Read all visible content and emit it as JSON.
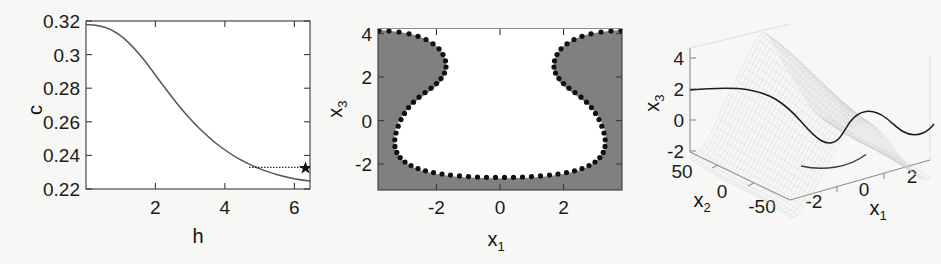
{
  "figure": {
    "background_color": "#f7f7f5",
    "panel_count": 3
  },
  "chart_data": [
    {
      "type": "line",
      "panel": "left",
      "title": "",
      "xlabel": "h",
      "ylabel": "c",
      "xlim": [
        0,
        6.45
      ],
      "ylim": [
        0.22,
        0.32
      ],
      "xticks": [
        2,
        4,
        6
      ],
      "xtick_labels": [
        "2",
        "4",
        "6"
      ],
      "yticks": [
        0.22,
        0.24,
        0.26,
        0.28,
        0.3,
        0.32
      ],
      "ytick_labels": [
        "0.22",
        "0.24",
        "0.26",
        "0.28",
        "0.3",
        "0.32"
      ],
      "grid": false,
      "legend": "none",
      "series": [
        {
          "name": "c(h)",
          "style": "solid-line",
          "color": "#555555",
          "x": [
            0.15,
            0.4,
            0.7,
            1.0,
            1.3,
            1.6,
            1.9,
            2.2,
            2.5,
            2.8,
            3.1,
            3.4,
            3.7,
            4.0,
            4.3,
            4.6,
            4.9,
            5.2,
            5.5,
            5.8,
            6.1,
            6.35
          ],
          "y": [
            0.3165,
            0.316,
            0.3145,
            0.3115,
            0.307,
            0.301,
            0.294,
            0.2865,
            0.2785,
            0.2705,
            0.2628,
            0.2556,
            0.249,
            0.2432,
            0.2383,
            0.2342,
            0.231,
            0.2285,
            0.2265,
            0.2248,
            0.2234,
            0.2226
          ]
        },
        {
          "name": "asymptote-marker-line",
          "style": "dotted-line",
          "color": "#2b2b2b",
          "x": [
            4.68,
            6.22
          ],
          "y": [
            0.2327,
            0.2327
          ]
        }
      ],
      "markers": [
        {
          "name": "star-marker",
          "symbol": "star",
          "x": 6.22,
          "y": 0.2327,
          "color": "#111111"
        }
      ]
    },
    {
      "type": "line",
      "panel": "middle",
      "title": "",
      "xlabel": "x_1",
      "xlabel_base": "x",
      "xlabel_sub": "1",
      "ylabel": "x_3",
      "ylabel_base": "x",
      "ylabel_sub": "3",
      "xlim": [
        -2.85,
        2.85
      ],
      "ylim": [
        -3.15,
        4.2
      ],
      "xticks": [
        -2,
        0,
        2
      ],
      "xtick_labels": [
        "-2",
        "0",
        "2"
      ],
      "yticks": [
        -2,
        0,
        2,
        4
      ],
      "ytick_labels": [
        "-2",
        "0",
        "2",
        "4"
      ],
      "grid": false,
      "legend": "none",
      "region_fill_color": "#808080",
      "region_inner_color": "#ffffff",
      "description": "gray region with white basin of attraction bounded by black dotted boundary points",
      "boundary_points_x": [
        -2.85,
        -2.62,
        -2.4,
        -2.18,
        -1.97,
        -1.78,
        -1.61,
        -1.46,
        -1.34,
        -1.25,
        -1.19,
        -1.16,
        -1.16,
        -1.19,
        -1.25,
        -1.34,
        -1.45,
        -1.57,
        -1.69,
        -1.8,
        -1.89,
        -1.96,
        -2.0,
        -2.01,
        -1.99,
        -1.94,
        -1.86,
        -1.75,
        -1.62,
        -1.47,
        -1.3,
        -1.12,
        -0.93,
        -0.73,
        -0.52,
        -0.31,
        -0.1,
        0.1,
        0.31,
        0.52,
        0.73,
        0.93,
        1.12,
        1.3,
        1.47,
        1.62,
        1.75,
        1.86,
        1.94,
        1.99,
        2.01,
        2.0,
        1.96,
        1.89,
        1.8,
        1.69,
        1.57,
        1.45,
        1.34,
        1.25,
        1.19,
        1.16,
        1.16,
        1.19,
        1.25,
        1.34,
        1.46,
        1.61,
        1.78,
        1.97,
        2.18,
        2.4,
        2.62,
        2.85
      ],
      "boundary_points_y": [
        3.95,
        3.92,
        3.86,
        3.76,
        3.62,
        3.44,
        3.23,
        2.99,
        2.73,
        2.46,
        2.18,
        1.9,
        1.62,
        1.35,
        1.09,
        0.86,
        0.65,
        0.46,
        0.29,
        0.13,
        -0.03,
        -0.2,
        -0.39,
        -0.59,
        -0.8,
        -1.01,
        -1.22,
        -1.42,
        -1.6,
        -1.76,
        -1.9,
        -2.02,
        -2.11,
        -2.18,
        -2.22,
        -2.25,
        -2.26,
        -2.26,
        -2.25,
        -2.22,
        -2.18,
        -2.11,
        -2.02,
        -1.9,
        -1.76,
        -1.6,
        -1.42,
        -1.22,
        -1.01,
        -0.8,
        -0.59,
        -0.39,
        -0.2,
        -0.03,
        0.13,
        0.29,
        0.46,
        0.65,
        0.86,
        1.09,
        1.35,
        1.62,
        1.9,
        2.18,
        2.46,
        2.73,
        2.99,
        3.23,
        3.44,
        3.62,
        3.76,
        3.86,
        3.92,
        3.95
      ],
      "marker_style": "filled-circle",
      "marker_color": "#111111"
    },
    {
      "type": "surface",
      "panel": "right",
      "title": "",
      "xlabel": "x_1",
      "xlabel_base": "x",
      "xlabel_sub": "1",
      "ylabel": "x_2",
      "ylabel_base": "x",
      "ylabel_sub": "2",
      "zlabel": "x_3",
      "zlabel_base": "x",
      "zlabel_sub": "3",
      "xticks": [
        -2,
        0,
        2
      ],
      "xtick_labels": [
        "-2",
        "0",
        "2"
      ],
      "yticks": [
        -50,
        0,
        50
      ],
      "ytick_labels": [
        "-50",
        "0",
        "50"
      ],
      "zticks": [
        -2,
        0,
        2,
        4
      ],
      "ztick_labels": [
        "-2",
        "0",
        "2",
        "4"
      ],
      "xlim": [
        -2.8,
        2.8
      ],
      "ylim": [
        -60,
        60
      ],
      "zlim": [
        -3,
        4.5
      ],
      "grid": false,
      "legend": "none",
      "mesh_color": "#c9c9c9",
      "contour_color": "#1c1c1c",
      "description": "3D wireframe mesh saddle/valley surface with dark contour curve traced across it"
    }
  ]
}
